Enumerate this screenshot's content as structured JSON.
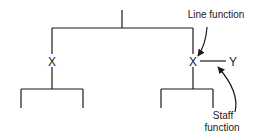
{
  "diagram": {
    "type": "organization-chart",
    "nodes": {
      "left_x": "X",
      "right_x": "X",
      "staff_y": "Y"
    },
    "annotations": {
      "line_function": "Line function",
      "staff_function_line1": "Staff",
      "staff_function_line2": "function"
    },
    "colors": {
      "line": "#1a1a1a",
      "background": "#ffffff"
    }
  }
}
